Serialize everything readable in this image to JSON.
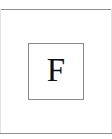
{
  "page": {
    "width": 112,
    "height": 139,
    "background_color": "#ffffff"
  },
  "frame": {
    "top_rule_color": "#8e8e8e",
    "bottom_rule_color": "#8e8e8e",
    "side_rule_color": "#e2e2e2"
  },
  "glyph_box": {
    "border_color": "#8a8a8a",
    "fill_color": "#ffffff",
    "letter": "F",
    "letter_color": "#101010"
  }
}
